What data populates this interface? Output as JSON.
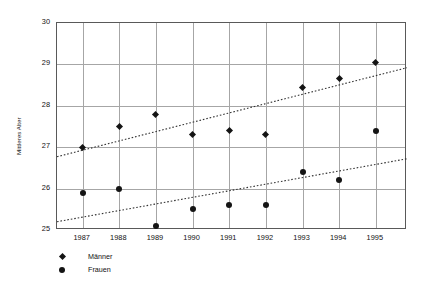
{
  "chart_data": {
    "type": "scatter",
    "title": "",
    "xlabel": "",
    "ylabel": "Mittleres Alter",
    "categories": [
      "1987",
      "1988",
      "1989",
      "1990",
      "1991",
      "1992",
      "1993",
      "1994",
      "1995"
    ],
    "x": [
      1987,
      1988,
      1989,
      1990,
      1991,
      1992,
      1993,
      1994,
      1995
    ],
    "xlim": [
      1986.3,
      1995.85
    ],
    "ylim": [
      25,
      30
    ],
    "yticks": [
      "25",
      "26",
      "27",
      "28",
      "29",
      "30"
    ],
    "ytick_values": [
      25,
      26,
      27,
      28,
      29,
      30
    ],
    "grid": true,
    "legend_position": "below-left",
    "series": [
      {
        "name": "Männer",
        "marker": "diamond",
        "color": "#141414",
        "values": [
          27.0,
          27.5,
          27.8,
          27.3,
          27.4,
          27.3,
          28.45,
          28.65,
          29.05
        ],
        "trendline": {
          "style": "dotted",
          "y_start": 26.77,
          "y_end": 28.92
        }
      },
      {
        "name": "Frauen",
        "marker": "circle",
        "color": "#141414",
        "values": [
          25.9,
          26.0,
          25.1,
          25.5,
          25.6,
          25.6,
          26.4,
          26.2,
          27.4
        ],
        "trendline": {
          "style": "dotted",
          "y_start": 25.2,
          "y_end": 26.72
        }
      }
    ]
  },
  "legend": {
    "items": [
      {
        "label": "Männer",
        "marker": "diamond"
      },
      {
        "label": "Frauen",
        "marker": "circle"
      }
    ]
  },
  "colors": {
    "marker": "#141414",
    "grid": "#a6a6a6",
    "axis": "#595959",
    "text": "#111111",
    "background": "#ffffff"
  }
}
